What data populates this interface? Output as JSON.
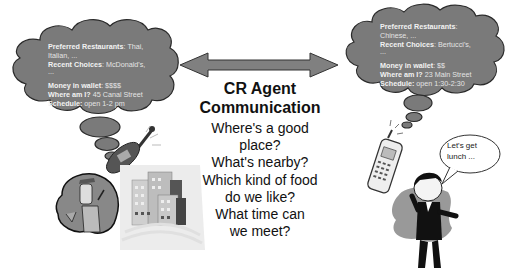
{
  "title": "CR Agent Communication",
  "title_lines": [
    "CR Agent",
    "Communication"
  ],
  "questions": [
    "Where's a good",
    "place?",
    "What's nearby?",
    "Which kind of food",
    "do we like?",
    "What time can",
    "we meet?"
  ],
  "left_agent": {
    "thought": {
      "preferred_label": "Preferred Restaurants",
      "preferred_value_line1": ": Thai,",
      "preferred_value_line2": "Italian, ...",
      "recent_label": "Recent Choices",
      "recent_value": ": McDonald's,",
      "recent_cont": "...",
      "money_label": "Money in wallet",
      "money_value": ": $$$$",
      "where_label": "Where am I?",
      "where_value": " 45 Canal Street",
      "schedule_label": "Schedule:",
      "schedule_value": " open 1-2 pm"
    },
    "figure": "businessman-on-phone-with-buildings"
  },
  "right_agent": {
    "thought": {
      "preferred_label": "Preferred Restaurants",
      "preferred_value_line1": ":",
      "preferred_value_line2": "Chinese, ...",
      "recent_label": "Recent Choices",
      "recent_value": ": Bertucci's,",
      "recent_cont": "...",
      "money_label": "Money in wallet",
      "money_value": ": $$",
      "where_label": "Where am I?",
      "where_value": " 23 Main Street",
      "schedule_label": "Schedule:",
      "schedule_value": " open 1:30-2:30"
    },
    "speech": [
      "Let's get",
      "lunch ..."
    ],
    "figure": "man-talking-on-cellphone"
  },
  "colors": {
    "cloud_fill": "#7a7a7a",
    "cloud_stroke": "#2a2a2a",
    "arrow_fill": "#808080",
    "text_dark": "#111111"
  }
}
